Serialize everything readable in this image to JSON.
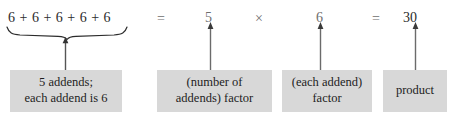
{
  "figure": {
    "clipped_top_line": "6 + 6 + 6 + 6 + 6",
    "colors": {
      "background": "#ffffff",
      "box_fill": "#d8d8d8",
      "text": "#1d1d1d",
      "faded_text": "#6e6e6e",
      "rule": "#2b2b2b"
    }
  },
  "equation": {
    "sum_expression": "6 + 6 + 6 + 6 + 6",
    "equals_first": "=",
    "first_factor": "5",
    "times": "×",
    "second_factor": "6",
    "equals_second": "=",
    "product": "30"
  },
  "annotations": {
    "addends": {
      "line1": "5 addends;",
      "line2": "each addend is 6"
    },
    "first_factor": {
      "line1": "(number of",
      "line2": "addends) factor"
    },
    "second_factor": {
      "line1": "(each addend)",
      "line2": "factor"
    },
    "product": {
      "line1": "product",
      "line2": ""
    }
  },
  "icons": {
    "underbrace": "underbrace-icon",
    "arrow_up": "arrow-up-icon"
  }
}
